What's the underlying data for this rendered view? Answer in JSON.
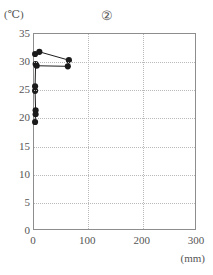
{
  "figure": {
    "panel_label": "②",
    "y_unit_label": "(℃)",
    "x_unit_label": "(mm)"
  },
  "chart_data": {
    "type": "scatter",
    "title": "②",
    "xlabel": "(mm)",
    "ylabel": "(℃)",
    "xlim": [
      0,
      300
    ],
    "ylim": [
      0,
      35
    ],
    "xticks": [
      0,
      100,
      200,
      300
    ],
    "yticks": [
      0,
      5,
      10,
      15,
      20,
      25,
      30,
      35
    ],
    "xtick_labels": [
      "0",
      "100",
      "200",
      "300"
    ],
    "ytick_labels": [
      "0",
      "5",
      "10",
      "15",
      "20",
      "25",
      "30",
      "35"
    ],
    "grid": true,
    "legend": "none",
    "marker": "filled-circle",
    "marker_color": "#1a1a1a",
    "line_color": "#1a1a1a",
    "series": [
      {
        "name": "series-1",
        "x": [
          2,
          10,
          65,
          63,
          5,
          3,
          2,
          2,
          3,
          3,
          2
        ],
        "y": [
          31.4,
          31.8,
          30.3,
          29.2,
          29.3,
          29.6,
          25.6,
          24.8,
          21.3,
          20.6,
          19.2
        ]
      }
    ]
  },
  "axis_geometry": {
    "y_gridline_values": [
      5,
      10,
      15,
      20,
      25,
      30
    ],
    "x_gridline_values": [
      100,
      200
    ]
  }
}
